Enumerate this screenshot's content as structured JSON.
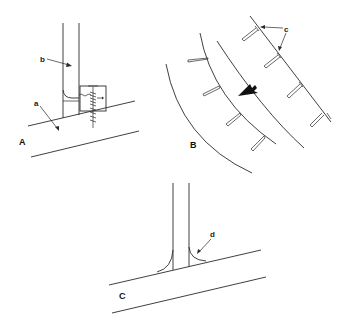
{
  "panels": [
    {
      "id": "A",
      "label": "A"
    },
    {
      "id": "B",
      "label": "B"
    },
    {
      "id": "C",
      "label": "C"
    }
  ],
  "callouts": {
    "a": "a",
    "b": "b",
    "c": "c",
    "d": "d"
  },
  "colors": {
    "line": "#2a2a2a",
    "background": "#ffffff"
  }
}
